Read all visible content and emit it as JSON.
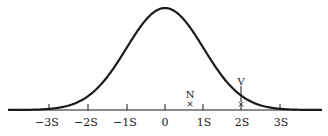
{
  "chart_data": {
    "type": "line",
    "title": "",
    "xlabel": "",
    "ylabel": "",
    "x_ticks": [
      -3,
      -2,
      -1,
      0,
      1,
      2,
      3
    ],
    "tick_labels": [
      "−3S",
      "−2S",
      "−1S",
      "0",
      "1S",
      "2S",
      "3S"
    ],
    "xlim": [
      -4.2,
      4.0
    ],
    "grid": false,
    "legend": null,
    "markers": [
      {
        "label": "N",
        "x": 0.65,
        "symbol": "x"
      },
      {
        "label": "V",
        "x": 2.0,
        "symbol": "x",
        "has_vertical_line": true
      }
    ],
    "curve": "gaussian(mean=0, sd=1)"
  },
  "axis": {
    "ticks": [
      {
        "label": "−3S"
      },
      {
        "label": "−2S"
      },
      {
        "label": "−1S"
      },
      {
        "label": "0"
      },
      {
        "label": "1S"
      },
      {
        "label": "2S"
      },
      {
        "label": "3S"
      }
    ]
  },
  "markers": {
    "n": {
      "label": "N",
      "symbol": "×"
    },
    "v": {
      "label": "V",
      "symbol": "×"
    }
  },
  "colors": {
    "ink": "#1a1a1a",
    "background": "#ffffff"
  }
}
